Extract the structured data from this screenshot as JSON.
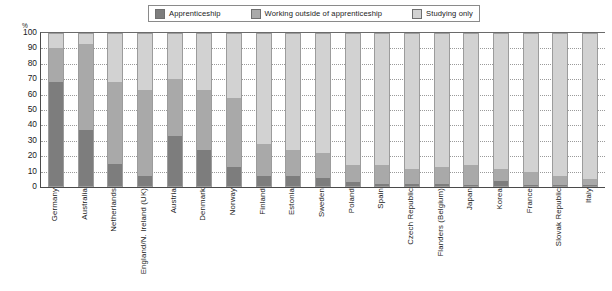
{
  "chart_data": {
    "type": "bar",
    "subtype": "stacked-bar-100-percent",
    "title": "",
    "xlabel": "",
    "ylabel": "%",
    "ylim": [
      0,
      100
    ],
    "yticks": [
      0,
      10,
      20,
      30,
      40,
      50,
      60,
      70,
      80,
      90,
      100
    ],
    "grid": true,
    "legend_position": "top-center",
    "categories": [
      "Germany",
      "Australia",
      "Netherlands",
      "England/N. Ireland (UK)",
      "Austria",
      "Denmark",
      "Norway",
      "Finland",
      "Estonia",
      "Sweden",
      "Poland",
      "Spain",
      "Czech Republic",
      "Flanders (Belgium)",
      "Japan",
      "Korea",
      "France",
      "Slovak Republic",
      "Italy"
    ],
    "series": [
      {
        "name": "Apprenticeship",
        "color": "#7d7d7d",
        "values": [
          68,
          37,
          15,
          7,
          33,
          24,
          13,
          7,
          7,
          6,
          3,
          2,
          2,
          2,
          1,
          4,
          1,
          1,
          1
        ]
      },
      {
        "name": "Working outside of apprenticeship",
        "color": "#a9a9a9",
        "values": [
          22,
          56,
          53,
          56,
          37,
          39,
          45,
          21,
          17,
          16,
          11,
          12,
          10,
          11,
          13,
          8,
          9,
          6,
          4
        ]
      },
      {
        "name": "Studying only",
        "color": "#d2d2d2",
        "values": [
          10,
          7,
          32,
          37,
          30,
          37,
          42,
          72,
          76,
          78,
          86,
          86,
          88,
          87,
          86,
          88,
          90,
          93,
          95
        ]
      }
    ]
  },
  "legend": {
    "items": [
      {
        "label": "Apprenticeship",
        "swatch_name": "legend-swatch-apprenticeship",
        "color": "#7d7d7d"
      },
      {
        "label": "Working outside of apprenticeship",
        "swatch_name": "legend-swatch-working-outside",
        "color": "#a9a9a9"
      },
      {
        "label": "Studying only",
        "swatch_name": "legend-swatch-studying-only",
        "color": "#d2d2d2"
      }
    ]
  },
  "axis": {
    "y_unit": "%",
    "y_tick_labels": [
      "100",
      "90",
      "80",
      "70",
      "60",
      "50",
      "40",
      "30",
      "20",
      "10",
      "0"
    ]
  }
}
